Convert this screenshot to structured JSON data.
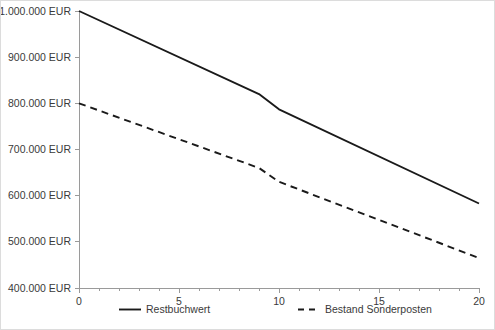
{
  "chart_data": {
    "type": "line",
    "title": "",
    "subtitle": "",
    "xlabel": "",
    "ylabel": "",
    "xlim": [
      0,
      20
    ],
    "ylim": [
      400000,
      1000000
    ],
    "grid": false,
    "legend_position": "bottom",
    "x_ticks": [
      0,
      5,
      10,
      15,
      20
    ],
    "x_tick_labels": [
      "0",
      "5",
      "10",
      "15",
      "20"
    ],
    "x_minor_tick_step": 1,
    "y_ticks": [
      400000,
      500000,
      600000,
      700000,
      800000,
      900000,
      1000000
    ],
    "y_tick_labels": [
      "400.000 EUR",
      "500.000 EUR",
      "600.000 EUR",
      "700.000 EUR",
      "800.000 EUR",
      "900.000 EUR",
      "1.000.000 EUR"
    ],
    "series": [
      {
        "name": "Restbuchwert",
        "style": "solid",
        "color": "#1a1a1a",
        "x": [
          0,
          9,
          10,
          20
        ],
        "values": [
          1000000,
          820000,
          787000,
          583000
        ]
      },
      {
        "name": "Bestand Sonderposten",
        "style": "dashed",
        "color": "#1a1a1a",
        "x": [
          0,
          9,
          10,
          20
        ],
        "values": [
          800000,
          660000,
          630000,
          465000
        ]
      }
    ]
  },
  "legend": {
    "items": [
      {
        "label": "Restbuchwert",
        "style": "solid"
      },
      {
        "label": "Bestand Sonderposten",
        "style": "dashed"
      }
    ]
  },
  "colors": {
    "background": "#ffffff",
    "border": "#dcdcdc",
    "axis": "#9a9a9a",
    "line": "#1a1a1a",
    "text": "#3a3a3a"
  }
}
